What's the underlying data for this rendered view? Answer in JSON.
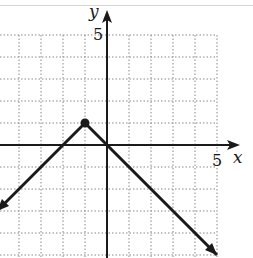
{
  "chart_data": {
    "type": "line",
    "title": "",
    "xlabel": "x",
    "ylabel": "y",
    "x_tick_labels": [
      {
        "value": 5,
        "label": "5"
      }
    ],
    "y_tick_labels": [
      {
        "value": 5,
        "label": "5"
      }
    ],
    "xlim": [
      -5,
      5
    ],
    "ylim": [
      -5,
      5
    ],
    "grid": true,
    "grid_style": "dotted",
    "legend": null,
    "series": [
      {
        "name": "piecewise absolute value",
        "points": [
          [
            -5,
            -3
          ],
          [
            -1,
            1
          ],
          [
            0,
            0
          ],
          [
            5,
            -5
          ]
        ],
        "left_arrow": true,
        "right_arrow": true,
        "color": "#1a1a1a"
      }
    ],
    "highlighted_points": [
      {
        "x": -1,
        "y": 1,
        "style": "filled-dot"
      }
    ],
    "annotations": []
  },
  "labels": {
    "x_axis": "x",
    "y_axis": "y",
    "x_tick_5": "5",
    "y_tick_5": "5"
  },
  "colors": {
    "grid": "#8a8a8a",
    "axis": "#1a1a1a",
    "line": "#1a1a1a"
  }
}
